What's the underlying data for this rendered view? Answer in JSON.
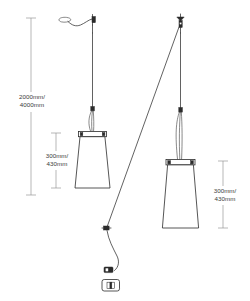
{
  "diagram": {
    "type": "technical-dimension-drawing",
    "background_color": "#ffffff",
    "line_color": "#2b2b2b",
    "dimension_line_color": "#9a9a9a",
    "text_color": "#3a3a3a"
  },
  "dimensions": [
    {
      "id": "drop-height",
      "label_line_1": "2000mm/",
      "label_line_2": "4000mm",
      "value_min": "2000mm",
      "value_max": "4000mm",
      "measures": "overall suspension drop height",
      "position": "left"
    },
    {
      "id": "shade-height-left",
      "label_line_1": "300mm/",
      "label_line_2": "430mm",
      "value_min": "300mm",
      "value_max": "430mm",
      "measures": "left pendant shade height",
      "position": "left-inner"
    },
    {
      "id": "shade-height-right",
      "label_line_1": "300mm/",
      "label_line_2": "430mm",
      "value_min": "300mm",
      "value_max": "430mm",
      "measures": "right pendant shade height",
      "position": "right"
    }
  ],
  "components": [
    {
      "id": "ceiling-rose",
      "name": "ceiling-rose-icon",
      "description": "ceiling mount rose with curved cable"
    },
    {
      "id": "ceiling-bracket",
      "name": "ceiling-bracket-icon",
      "description": "vertical ceiling mounting bracket"
    },
    {
      "id": "ceiling-pulley",
      "name": "ceiling-pulley-icon",
      "description": "ceiling pulley mount for diagonal cable"
    },
    {
      "id": "pendant-left",
      "name": "pendant-shade-left",
      "description": "left tapered conical lamp shade"
    },
    {
      "id": "pendant-right",
      "name": "pendant-shade-right",
      "description": "right tapered conical lamp shade"
    },
    {
      "id": "cable-connector",
      "name": "cable-connector-node",
      "description": "inline cable junction connector"
    },
    {
      "id": "inline-switch",
      "name": "inline-switch-icon",
      "description": "inline cord switch"
    },
    {
      "id": "power-plug",
      "name": "power-plug-icon",
      "description": "mains power plug"
    }
  ]
}
